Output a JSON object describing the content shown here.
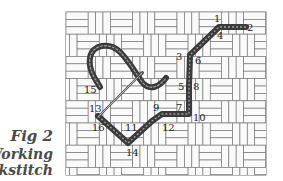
{
  "figure": {
    "caption_title": "Fig 2",
    "caption_line2": "Working",
    "caption_line3": "backstitch"
  },
  "colors": {
    "grid_line": "#7a7a7a",
    "grid_fill": "#ffffff",
    "grid_cell": "#e8e8e8",
    "thread": "#3c3c3c",
    "thread_highlight": "#9a9a9a",
    "needle": "#555555",
    "label": "#1a1a1a"
  },
  "stitch_points": [
    {
      "label": "1"
    },
    {
      "label": "2"
    },
    {
      "label": "3"
    },
    {
      "label": "4"
    },
    {
      "label": "5"
    },
    {
      "label": "6"
    },
    {
      "label": "7"
    },
    {
      "label": "8"
    },
    {
      "label": "9"
    },
    {
      "label": "10"
    },
    {
      "label": "11"
    },
    {
      "label": "12"
    },
    {
      "label": "13"
    },
    {
      "label": "14"
    },
    {
      "label": "15"
    },
    {
      "label": "16"
    }
  ]
}
